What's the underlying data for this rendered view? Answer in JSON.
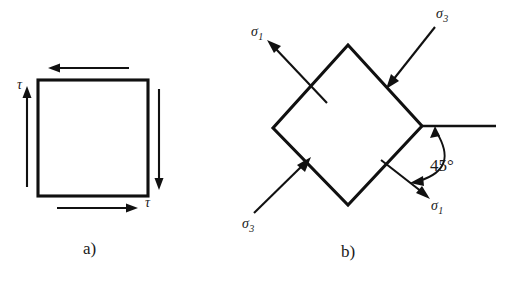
{
  "figure": {
    "background_color": "#ffffff",
    "ink_color": "#111111",
    "width": 506,
    "height": 284
  },
  "panel_a": {
    "caption": "a)",
    "shape": "square",
    "shear_labels": [
      {
        "id": "tau-left",
        "text": "τ",
        "x": 20,
        "y": 78
      },
      {
        "id": "tau-bottom",
        "text": "τ",
        "x": 146,
        "y": 197
      }
    ],
    "arrows": [
      {
        "id": "top-arrow",
        "direction": "left"
      },
      {
        "id": "right-arrow",
        "direction": "down"
      },
      {
        "id": "bottom-arrow",
        "direction": "right"
      },
      {
        "id": "left-arrow",
        "direction": "up"
      }
    ]
  },
  "panel_b": {
    "caption": "b)",
    "shape": "diamond",
    "angle_label": "45°",
    "stress_labels": [
      {
        "id": "sigma1-top-left",
        "base": "σ",
        "sub": "1",
        "x": 252,
        "y": 26
      },
      {
        "id": "sigma3-top-right",
        "base": "σ",
        "sub": "3",
        "x": 436,
        "y": 8
      },
      {
        "id": "sigma3-bottom-left",
        "base": "σ",
        "sub": "3",
        "x": 243,
        "y": 218
      },
      {
        "id": "sigma1-bottom-right",
        "base": "σ",
        "sub": "1",
        "x": 430,
        "y": 200
      }
    ],
    "arrows": [
      {
        "id": "sigma1-arrow-top-left",
        "direction": "up-left",
        "type": "tension"
      },
      {
        "id": "sigma3-arrow-top-right",
        "direction": "down-left",
        "type": "compression"
      },
      {
        "id": "sigma3-arrow-bottom-left",
        "direction": "up-right",
        "type": "compression"
      },
      {
        "id": "sigma1-arrow-bottom-right",
        "direction": "down-right",
        "type": "tension"
      }
    ],
    "reference_line": {
      "id": "horizontal-reference-line",
      "from_x": 422,
      "to_x": 496,
      "y": 126
    }
  }
}
